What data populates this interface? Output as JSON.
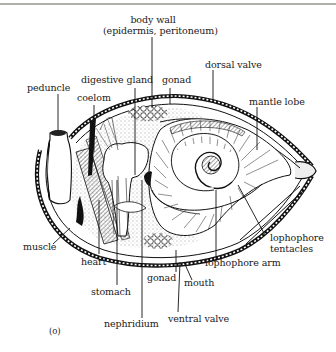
{
  "figure": {
    "panel_label": "(o)",
    "labels": {
      "body_wall_line1": "body wall",
      "body_wall_line2": "(epidermis, peritoneum)",
      "dorsal_valve": "dorsal valve",
      "digestive_gland": "digestive gland",
      "gonad_top": "gonad",
      "peduncle": "peduncle",
      "coelom": "coelom",
      "mantle_lobe": "mantle lobe",
      "muscle": "muscle",
      "lophophore_tentacles_line1": "lophophore",
      "lophophore_tentacles_line2": "tentacles",
      "heart": "heart",
      "lophophore_arm": "lophophore arm",
      "gonad_bottom": "gonad",
      "mouth": "mouth",
      "stomach": "stomach",
      "ventral_valve": "ventral valve",
      "nephridium": "nephridium"
    }
  },
  "colors": {
    "ink": "#1a1a1a",
    "paper": "#ffffff",
    "rule": "#b0b0a8"
  }
}
